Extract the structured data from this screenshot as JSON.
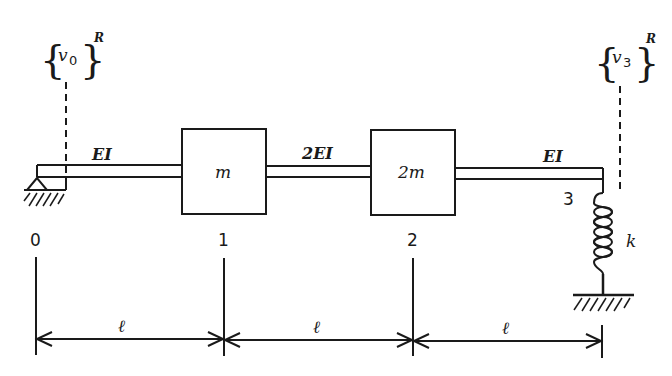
{
  "diagram": {
    "type": "beam-mass-spring-system",
    "colors": {
      "line": "#1a1a1a",
      "background": "#ffffff"
    },
    "labels": {
      "v0_var": "v",
      "v0_sub": "0",
      "v0_sup": "R",
      "v3_var": "v",
      "v3_sub": "3",
      "v3_sup": "R"
    },
    "segments": [
      {
        "stiffness": "EI",
        "length": "ℓ"
      },
      {
        "stiffness": "2EI",
        "length": "ℓ"
      },
      {
        "stiffness": "EI",
        "length": "ℓ"
      }
    ],
    "masses": [
      {
        "label": "m",
        "node": "1"
      },
      {
        "label": "2m",
        "node": "2"
      }
    ],
    "nodes": [
      "0",
      "1",
      "2",
      "3"
    ],
    "spring": {
      "label": "k"
    },
    "supports": {
      "left": "pin",
      "spring_base": "ground"
    }
  }
}
